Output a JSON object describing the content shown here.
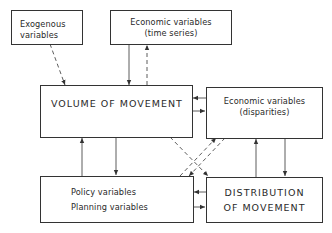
{
  "diagram": {
    "nodes": {
      "exogenous": {
        "lines": [
          "Exogenous",
          "variables"
        ]
      },
      "econ_time": {
        "lines": [
          "Economic variables",
          "(time series)"
        ]
      },
      "volume": {
        "lines": [
          "VOLUME OF MOVEMENT"
        ]
      },
      "econ_disp": {
        "lines": [
          "Economic variables",
          "(disparities)"
        ]
      },
      "policy": {
        "lines": [
          "Policy variables",
          "Planning variables"
        ]
      },
      "distribution": {
        "lines": [
          "DISTRIBUTION",
          "OF MOVEMENT"
        ]
      }
    },
    "edges": [
      {
        "from": "exogenous",
        "to": "volume",
        "style": "dashed"
      },
      {
        "from": "econ_time",
        "to": "volume",
        "style": "solid"
      },
      {
        "from": "volume",
        "to": "econ_time",
        "style": "dashed"
      },
      {
        "from": "econ_disp",
        "to": "volume",
        "style": "solid"
      },
      {
        "from": "volume",
        "to": "econ_disp",
        "style": "solid"
      },
      {
        "from": "policy",
        "to": "volume",
        "style": "solid"
      },
      {
        "from": "volume",
        "to": "policy",
        "style": "solid"
      },
      {
        "from": "volume",
        "to": "distribution",
        "style": "dashed"
      },
      {
        "from": "policy",
        "to": "econ_disp",
        "style": "dashed"
      },
      {
        "from": "econ_disp",
        "to": "policy",
        "style": "dashed"
      },
      {
        "from": "distribution",
        "to": "econ_disp",
        "style": "solid"
      },
      {
        "from": "econ_disp",
        "to": "distribution",
        "style": "solid"
      },
      {
        "from": "distribution",
        "to": "policy",
        "style": "solid"
      },
      {
        "from": "policy",
        "to": "distribution",
        "style": "solid"
      }
    ],
    "colors": {
      "line": "#333333",
      "text": "#2a2a2a",
      "background": "#ffffff"
    }
  }
}
